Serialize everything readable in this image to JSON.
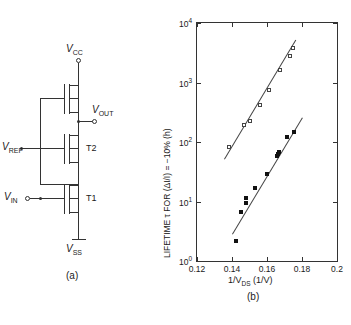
{
  "figure": {
    "panel_a_tag": "(a)",
    "panel_b_tag": "(b)"
  },
  "circuit": {
    "supply_top_label": "V",
    "supply_top_sub": "CC",
    "supply_bottom_label": "V",
    "supply_bottom_sub": "SS",
    "out_label": "V",
    "out_sub": "OUT",
    "ref_label": "V",
    "ref_sub": "REF",
    "in_label": "V",
    "in_sub": "IN",
    "transistor_upper": "T2",
    "transistor_lower": "T1"
  },
  "chart_data": {
    "type": "scatter",
    "title": "",
    "xlabel_main": "1/V",
    "xlabel_sub": "DS",
    "xlabel_unit": "(1/V)",
    "ylabel": "LIFETIME τ FOR (ΔI/I) = −10% (h)",
    "xlim": [
      0.12,
      0.2
    ],
    "ylim_log": [
      0,
      4
    ],
    "xscale": "linear",
    "yscale": "log",
    "grid": false,
    "legend": "none",
    "xticks": [
      0.12,
      0.14,
      0.16,
      0.18,
      0.2
    ],
    "xticklabels": [
      "0.12",
      "0.14",
      "0.16",
      "0.18",
      "0.2"
    ],
    "yticks_log": [
      0,
      1,
      2,
      3,
      4
    ],
    "yticklabels": [
      "10",
      "10",
      "10",
      "10",
      "10"
    ],
    "yticklabel_exponents": [
      "0",
      "1",
      "2",
      "3",
      "4"
    ],
    "series": [
      {
        "name": "open-squares",
        "marker": "open-square",
        "points": [
          {
            "x": 0.1385,
            "y_log": 1.92
          },
          {
            "x": 0.1468,
            "y_log": 2.28
          },
          {
            "x": 0.1505,
            "y_log": 2.36
          },
          {
            "x": 0.156,
            "y_log": 2.62
          },
          {
            "x": 0.1612,
            "y_log": 2.88
          },
          {
            "x": 0.1672,
            "y_log": 3.21
          },
          {
            "x": 0.173,
            "y_log": 3.44
          },
          {
            "x": 0.1746,
            "y_log": 3.58
          }
        ],
        "fit": {
          "x1": 0.1355,
          "y1_log": 1.72,
          "x2": 0.1762,
          "y2_log": 3.72
        }
      },
      {
        "name": "filled-squares",
        "marker": "filled-square",
        "points": [
          {
            "x": 0.142,
            "y_log": 0.33
          },
          {
            "x": 0.1452,
            "y_log": 0.83
          },
          {
            "x": 0.1478,
            "y_log": 0.98
          },
          {
            "x": 0.148,
            "y_log": 1.06
          },
          {
            "x": 0.153,
            "y_log": 1.22
          },
          {
            "x": 0.1598,
            "y_log": 1.47
          },
          {
            "x": 0.1655,
            "y_log": 1.76
          },
          {
            "x": 0.166,
            "y_log": 1.8
          },
          {
            "x": 0.1668,
            "y_log": 1.84
          },
          {
            "x": 0.1712,
            "y_log": 2.08
          },
          {
            "x": 0.1752,
            "y_log": 2.16
          }
        ],
        "fit": {
          "x1": 0.14,
          "y1_log": 0.46,
          "x2": 0.18,
          "y2_log": 2.42
        }
      }
    ]
  }
}
